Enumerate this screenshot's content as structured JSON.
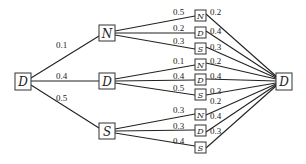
{
  "diagram": {
    "type": "probability-tree",
    "root": {
      "label": "D"
    },
    "final": {
      "label": "D"
    },
    "branches": [
      {
        "label": "N",
        "prob": "0.1",
        "children": [
          {
            "label": "N",
            "prob": "0.5",
            "to_final": "0.2"
          },
          {
            "label": "D",
            "prob": "0.2",
            "to_final": "0.4"
          },
          {
            "label": "S",
            "prob": "0.3",
            "to_final": "0.3"
          }
        ]
      },
      {
        "label": "D",
        "prob": "0.4",
        "children": [
          {
            "label": "N",
            "prob": "0.1",
            "to_final": "0.2"
          },
          {
            "label": "D",
            "prob": "0.4",
            "to_final": "0.4"
          },
          {
            "label": "S",
            "prob": "0.5",
            "to_final": "0.3"
          }
        ]
      },
      {
        "label": "S",
        "prob": "0.5",
        "children": [
          {
            "label": "N",
            "prob": "0.3",
            "to_final": "0.2"
          },
          {
            "label": "D",
            "prob": "0.3",
            "to_final": "0.4"
          },
          {
            "label": "S",
            "prob": "0.4",
            "to_final": "0.3"
          }
        ]
      }
    ]
  }
}
